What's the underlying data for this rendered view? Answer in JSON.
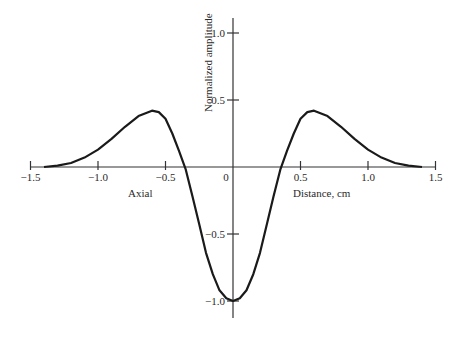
{
  "chart_data": {
    "type": "line",
    "title": "",
    "xlabel": "Distance, cm",
    "ylabel": "Normalized amplitude",
    "annotations": [
      "Axial"
    ],
    "xlim": [
      -1.5,
      1.5
    ],
    "ylim": [
      -1.0,
      1.0
    ],
    "grid": false,
    "legend": null,
    "x_ticks": [
      -1.5,
      -1.0,
      -0.5,
      0,
      0.5,
      1.0,
      1.5
    ],
    "x_tick_labels": [
      "−1.5",
      "−1.0",
      "−0.5",
      "0",
      "0.5",
      "1.0",
      "1.5"
    ],
    "y_ticks": [
      1.0,
      0.5,
      -0.5,
      -1.0
    ],
    "y_tick_labels": [
      "1.0",
      "0.5",
      "−0.5",
      "−1.0"
    ],
    "series": [
      {
        "name": "Axial",
        "color": "#1a1a1a",
        "x": [
          -1.4,
          -1.3,
          -1.2,
          -1.1,
          -1.0,
          -0.9,
          -0.8,
          -0.7,
          -0.6,
          -0.55,
          -0.5,
          -0.45,
          -0.4,
          -0.35,
          -0.3,
          -0.25,
          -0.2,
          -0.15,
          -0.1,
          -0.05,
          0,
          0.05,
          0.1,
          0.15,
          0.2,
          0.25,
          0.3,
          0.35,
          0.4,
          0.45,
          0.5,
          0.55,
          0.6,
          0.7,
          0.8,
          0.9,
          1.0,
          1.1,
          1.2,
          1.3,
          1.4
        ],
        "y": [
          0.0,
          0.01,
          0.03,
          0.07,
          0.13,
          0.21,
          0.3,
          0.38,
          0.42,
          0.41,
          0.36,
          0.25,
          0.12,
          -0.02,
          -0.22,
          -0.43,
          -0.64,
          -0.8,
          -0.92,
          -0.98,
          -1.0,
          -0.98,
          -0.92,
          -0.8,
          -0.64,
          -0.43,
          -0.22,
          -0.02,
          0.12,
          0.25,
          0.36,
          0.41,
          0.42,
          0.38,
          0.3,
          0.21,
          0.13,
          0.07,
          0.03,
          0.01,
          0.0
        ]
      }
    ]
  },
  "layout": {
    "x_origin_px": 233,
    "y_origin_px": 167,
    "x_scale_px": 135,
    "y_scale_px": 134
  }
}
